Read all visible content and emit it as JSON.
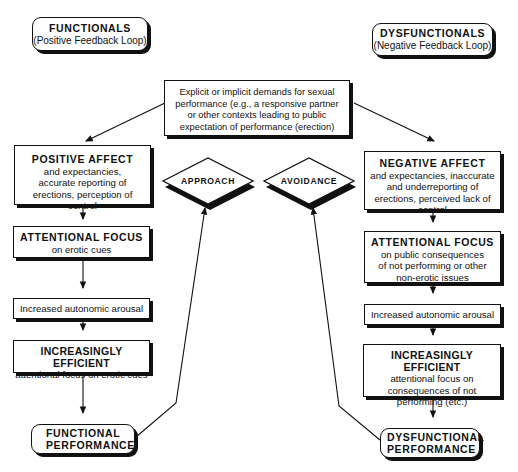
{
  "headers": {
    "left": {
      "title": "FUNCTIONALS",
      "subtitle": "(Positive Feedback Loop)"
    },
    "right": {
      "title": "DYSFUNCTIONALS",
      "subtitle": "(Negative Feedback Loop)"
    }
  },
  "top_box": {
    "text": "Explicit or implicit demands for sexual performance (e.g., a responsive partner or other contexts leading to public expectation of performance (erection)"
  },
  "decisions": {
    "approach": "APPROACH",
    "avoidance": "AVOIDANCE"
  },
  "left_chain": [
    {
      "title": "POSITIVE AFFECT",
      "text": "and expectancies, accurate reporting of erections, perception of control"
    },
    {
      "title": "ATTENTIONAL FOCUS",
      "text": "on erotic cues"
    },
    {
      "title": "",
      "text": "Increased autonomic arousal"
    },
    {
      "title": "INCREASINGLY EFFICIENT",
      "text": "attentional focus on erotic cues"
    },
    {
      "title": "FUNCTIONAL PERFORMANCE",
      "text": ""
    }
  ],
  "right_chain": [
    {
      "title": "NEGATIVE AFFECT",
      "text": "and expectancies, inaccurate and underreporting of erections, perceived lack of control"
    },
    {
      "title": "ATTENTIONAL FOCUS",
      "text": "on public consequences of not performing or other non-erotic issues"
    },
    {
      "title": "",
      "text": "Increased autonomic arousal"
    },
    {
      "title": "INCREASINGLY EFFICIENT",
      "text": "attentional focus on consequences of not performing (etc.)"
    },
    {
      "title": "DYSFUNCTIONAL PERFORMANCE",
      "text": ""
    }
  ],
  "colors": {
    "ink": "#111111",
    "background": "#ffffff"
  }
}
